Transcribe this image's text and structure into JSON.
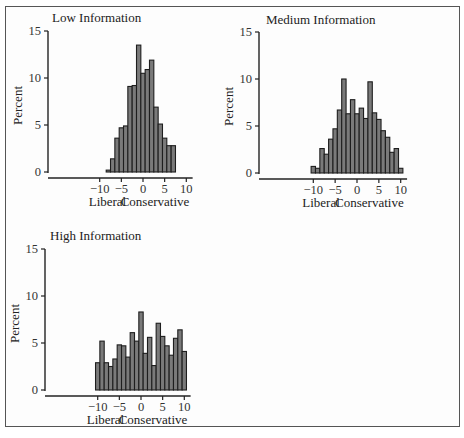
{
  "figure": {
    "panels": [
      {
        "id": "low",
        "title": "Low Information"
      },
      {
        "id": "medium",
        "title": "Medium Information"
      },
      {
        "id": "high",
        "title": "High Information"
      }
    ]
  },
  "chart_data": [
    {
      "type": "bar",
      "title": "Low Information",
      "xlabel_left": "Liberal",
      "xlabel_right": "Conservative",
      "ylabel": "Percent",
      "xlim": [
        -11,
        11
      ],
      "ylim": [
        0,
        15
      ],
      "xticks": [
        -10,
        -5,
        0,
        5,
        10
      ],
      "yticks": [
        0,
        5,
        10,
        15
      ],
      "grid": false,
      "bin_width": 1,
      "categories": [
        -8,
        -7,
        -6,
        -5,
        -4,
        -3,
        -2,
        -1,
        0,
        1,
        2,
        3,
        4,
        5,
        6,
        7
      ],
      "values": [
        0.2,
        1.4,
        3.6,
        4.7,
        4.9,
        9.1,
        9.2,
        13.5,
        10.5,
        10.9,
        11.9,
        6.9,
        5.1,
        3.6,
        2.8,
        2.8
      ]
    },
    {
      "type": "bar",
      "title": "Medium Information",
      "xlabel_left": "Liberal",
      "xlabel_right": "Conservative",
      "ylabel": "Percent",
      "xlim": [
        -11,
        11
      ],
      "ylim": [
        0,
        15
      ],
      "xticks": [
        -10,
        -5,
        0,
        5,
        10
      ],
      "yticks": [
        0,
        5,
        10,
        15
      ],
      "grid": false,
      "bin_width": 1,
      "categories": [
        -10,
        -9,
        -8,
        -7,
        -6,
        -5,
        -4,
        -3,
        -2,
        -1,
        0,
        1,
        2,
        3,
        4,
        5,
        6,
        7,
        8,
        9,
        10
      ],
      "values": [
        0.7,
        0.5,
        2.6,
        2.0,
        3.6,
        4.7,
        6.7,
        10.0,
        6.3,
        7.8,
        6.3,
        6.9,
        5.8,
        9.7,
        6.4,
        5.7,
        4.5,
        3.8,
        2.2,
        2.6,
        0.5
      ]
    },
    {
      "type": "bar",
      "title": "High Information",
      "xlabel_left": "Liberal",
      "xlabel_right": "Conservative",
      "ylabel": "Percent",
      "xlim": [
        -11,
        11
      ],
      "ylim": [
        0,
        15
      ],
      "xticks": [
        -10,
        -5,
        0,
        5,
        10
      ],
      "yticks": [
        0,
        5,
        10,
        15
      ],
      "grid": false,
      "bin_width": 1,
      "categories": [
        -10,
        -9,
        -8,
        -7,
        -6,
        -5,
        -4,
        -3,
        -2,
        -1,
        0,
        1,
        2,
        3,
        4,
        5,
        6,
        7,
        8,
        9,
        10
      ],
      "values": [
        2.9,
        5.2,
        2.9,
        2.5,
        3.3,
        4.8,
        4.7,
        3.5,
        6.1,
        5.2,
        8.3,
        3.9,
        5.6,
        2.6,
        7.1,
        5.7,
        4.7,
        3.7,
        5.5,
        6.4,
        4.1
      ]
    }
  ],
  "layout": {
    "panels": [
      {
        "axis_x": 48,
        "zero_x": 143,
        "unit_x": 4.33,
        "zero_y": 172,
        "unit_y": 9.4,
        "axis_bottom": 178,
        "title_x": 52,
        "title_y": 22
      },
      {
        "axis_x": 259,
        "zero_x": 357,
        "unit_x": 4.37,
        "zero_y": 173,
        "unit_y": 9.4,
        "axis_bottom": 179,
        "title_x": 266,
        "title_y": 24
      },
      {
        "axis_x": 45,
        "zero_x": 141,
        "unit_x": 4.33,
        "zero_y": 390,
        "unit_y": 9.4,
        "axis_bottom": 396,
        "title_x": 50,
        "title_y": 240
      }
    ]
  }
}
